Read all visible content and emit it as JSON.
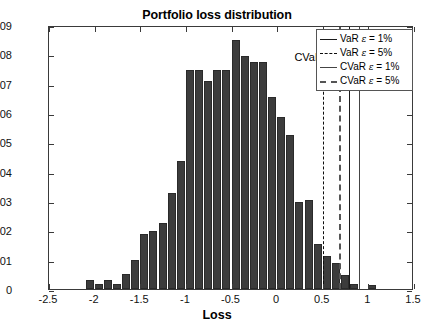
{
  "chart_data": {
    "type": "bar",
    "title": "Portfolio loss distribution",
    "xlabel": "Loss",
    "ylabel": "",
    "xlim": [
      -2.5,
      1.5
    ],
    "ylim": [
      0,
      0.09
    ],
    "grid": false,
    "bin_width": 0.1,
    "bar_color": "#3c3c3c",
    "xticks": [
      -2.5,
      -2,
      -1.5,
      -1,
      -0.5,
      0,
      0.5,
      1,
      1.5
    ],
    "xtick_labels": [
      "-2.5",
      "-2",
      "-1.5",
      "-1",
      "-0.5",
      "0",
      "0.5",
      "1",
      "1.5"
    ],
    "yticks": [
      0,
      0.01,
      0.02,
      0.03,
      0.04,
      0.05,
      0.06,
      0.07,
      0.08,
      0.09
    ],
    "ytick_labels": [
      "0",
      "0.01",
      "0.02",
      "0.03",
      "0.04",
      "0.05",
      "0.06",
      "0.07",
      "0.08",
      "0.09"
    ],
    "bins": [
      {
        "x": -2.05,
        "value": 0.003
      },
      {
        "x": -1.95,
        "value": 0.0017
      },
      {
        "x": -1.85,
        "value": 0.003
      },
      {
        "x": -1.75,
        "value": 0.0017
      },
      {
        "x": -1.65,
        "value": 0.005
      },
      {
        "x": -1.55,
        "value": 0.0098
      },
      {
        "x": -1.45,
        "value": 0.0187
      },
      {
        "x": -1.35,
        "value": 0.0197
      },
      {
        "x": -1.25,
        "value": 0.0226
      },
      {
        "x": -1.15,
        "value": 0.0327
      },
      {
        "x": -1.05,
        "value": 0.0438
      },
      {
        "x": -0.95,
        "value": 0.0745
      },
      {
        "x": -0.85,
        "value": 0.0745
      },
      {
        "x": -0.75,
        "value": 0.0708
      },
      {
        "x": -0.65,
        "value": 0.0745
      },
      {
        "x": -0.55,
        "value": 0.0745
      },
      {
        "x": -0.45,
        "value": 0.085
      },
      {
        "x": -0.35,
        "value": 0.0795
      },
      {
        "x": -0.25,
        "value": 0.0775
      },
      {
        "x": -0.15,
        "value": 0.0775
      },
      {
        "x": -0.05,
        "value": 0.0655
      },
      {
        "x": 0.05,
        "value": 0.0585
      },
      {
        "x": 0.15,
        "value": 0.0525
      },
      {
        "x": 0.25,
        "value": 0.0295
      },
      {
        "x": 0.35,
        "value": 0.0305
      },
      {
        "x": 0.45,
        "value": 0.0155
      },
      {
        "x": 0.55,
        "value": 0.0113
      },
      {
        "x": 0.65,
        "value": 0.0088
      },
      {
        "x": 0.75,
        "value": 0.0048
      },
      {
        "x": 0.85,
        "value": 0.0017
      },
      {
        "x": 1.05,
        "value": 0.0012
      }
    ],
    "reference_lines": [
      {
        "name": "VaR epsilon = 5%",
        "x": 0.5,
        "style": "dashed-thin",
        "color": "#0d0d0d"
      },
      {
        "name": "CVaR epsilon = 5%",
        "x": 0.68,
        "style": "dashed-thick",
        "color": "#555555"
      },
      {
        "name": "VaR epsilon = 1%",
        "x": 0.79,
        "style": "solid-thin",
        "color": "#1a1a1a"
      },
      {
        "name": "CVaR epsilon = 1%",
        "x": 0.9,
        "style": "solid-thick",
        "color": "#444444"
      }
    ],
    "annotations": [
      {
        "text": "CVaR",
        "sub": "ε",
        "suffix": "(R",
        "sub2": "T",
        "suffix2": ")",
        "x": 0.2,
        "y": 0.0775
      }
    ]
  },
  "annotation_text": {
    "prefix": "CVaR",
    "sub_eps": "ε",
    "mid": "(R",
    "sub_t": "T",
    "close": ")"
  },
  "legend": {
    "items": [
      {
        "label_pre": "VaR ",
        "eps": "ε",
        "label_post": " = 1%",
        "style": "solid-thin"
      },
      {
        "label_pre": "VaR ",
        "eps": "ε",
        "label_post": " = 5%",
        "style": "dashed-thin"
      },
      {
        "label_pre": "CVaR ",
        "eps": "ε",
        "label_post": " = 1%",
        "style": "solid-thick"
      },
      {
        "label_pre": "CVaR ",
        "eps": "ε",
        "label_post": " = 5%",
        "style": "dashed-thick"
      }
    ]
  }
}
